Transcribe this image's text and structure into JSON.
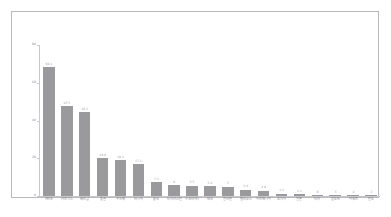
{
  "chart_data": {
    "type": "bar",
    "title": "",
    "subtitle": "",
    "xlabel": "",
    "ylabel": "",
    "ylim": [
      0,
      80
    ],
    "yticks": [
      0,
      20,
      40,
      60,
      80
    ],
    "ytick_labels": [
      "0",
      "20",
      "40",
      "60",
      "80"
    ],
    "grid": false,
    "legend": false,
    "bar_color": "#9a9a9c",
    "value_label_color": "#9e9ea2",
    "axis_color": "#c9c9cd",
    "frame_color": "#b9b9bd",
    "background": "#ffffff",
    "categories": [
      "카자흐",
      "키르기스",
      "베트남",
      "몽골",
      "우즈벡",
      "러시아",
      "중국",
      "타지키스탄",
      "우크라이나",
      "태국",
      "필리핀",
      "벨라루스",
      "아르메니아",
      "조지아",
      "일본",
      "터키",
      "몰도바",
      "아제르",
      "인도"
    ],
    "values": [
      68.1,
      47.5,
      44.3,
      19.9,
      19.2,
      17.1,
      7.3,
      6.0,
      5.5,
      5.4,
      5.0,
      3.4,
      2.9,
      1.3,
      1.1,
      0.6,
      0.5,
      0.4,
      0.3
    ],
    "value_labels": [
      "68.1",
      "47.5",
      "44.3",
      "19.9",
      "19.2",
      "17.1",
      "7.3",
      "6",
      "5.5",
      "5.4",
      "5",
      "3.4",
      "2.9",
      "1.3",
      "1.1",
      ".6",
      ".5",
      ".4",
      ".3"
    ]
  }
}
